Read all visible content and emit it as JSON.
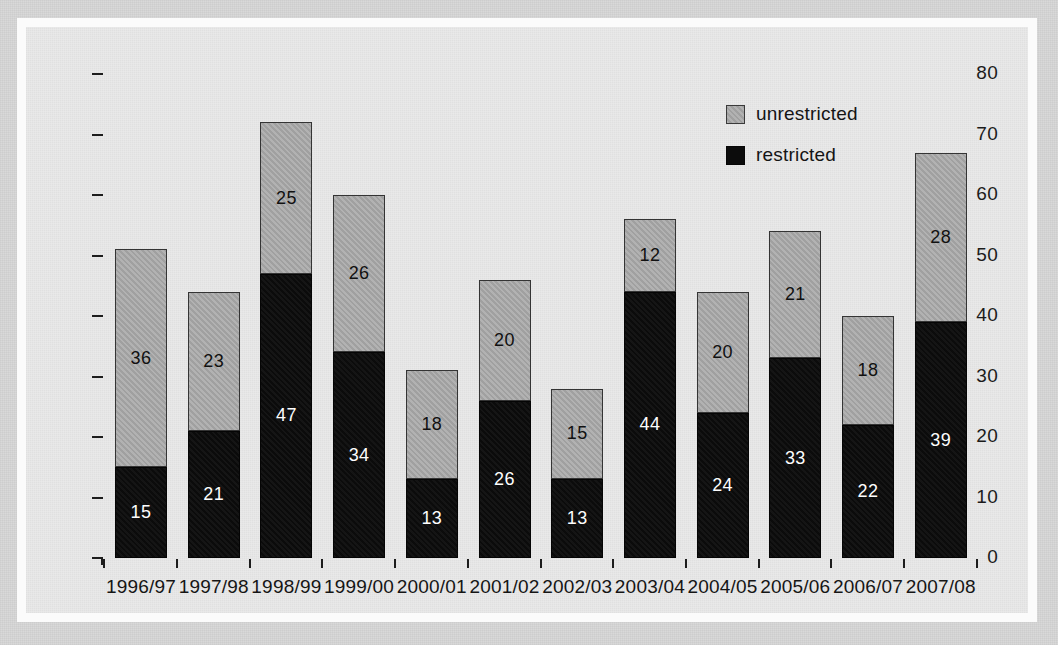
{
  "chart_data": {
    "type": "bar",
    "subtype": "stacked-vertical",
    "title": "",
    "xlabel": "",
    "ylabel": "",
    "ylim": [
      0,
      80
    ],
    "yticks": [
      0,
      10,
      20,
      30,
      40,
      50,
      60,
      70,
      80
    ],
    "grid": false,
    "legend_position": "inside-top-right",
    "categories": [
      "1996/97",
      "1997/98",
      "1998/99",
      "1999/00",
      "2000/01",
      "2001/02",
      "2002/03",
      "2003/04",
      "2004/05",
      "2005/06",
      "2006/07",
      "2007/08"
    ],
    "series": [
      {
        "name": "restricted",
        "color": "#0c0c0c",
        "values": [
          15,
          21,
          47,
          34,
          13,
          26,
          13,
          44,
          24,
          33,
          22,
          39
        ]
      },
      {
        "name": "unrestricted",
        "color": "#a9a9a9",
        "values": [
          36,
          23,
          25,
          26,
          18,
          20,
          15,
          12,
          20,
          21,
          18,
          28
        ]
      }
    ],
    "totals": [
      51,
      44,
      72,
      60,
      31,
      46,
      28,
      56,
      44,
      54,
      40,
      67
    ],
    "data_labels": true,
    "annotations": []
  },
  "legend": {
    "items": [
      {
        "label": "unrestricted",
        "swatch": "gray-square-icon"
      },
      {
        "label": "restricted",
        "swatch": "black-square-icon"
      }
    ]
  },
  "axis": {
    "y_tick_labels": [
      "80",
      "70",
      "60",
      "50",
      "40",
      "30",
      "20",
      "10",
      "0"
    ],
    "x_tick_labels": [
      "1996/97",
      "1997/98",
      "1998/99",
      "1999/00",
      "2000/01",
      "2001/02",
      "2002/03",
      "2003/04",
      "2004/05",
      "2005/06",
      "2006/07",
      "2007/08"
    ]
  },
  "colors": {
    "background": "#e9e9e9",
    "page": "#d7d7d7",
    "frame": "#fbfbfb",
    "restricted": "#0c0c0c",
    "unrestricted": "#a9a9a9",
    "axis": "#1d1d1d",
    "text": "#141414"
  }
}
